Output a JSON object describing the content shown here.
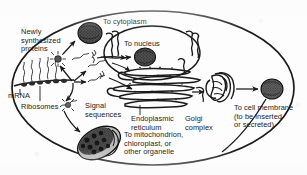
{
  "figure": {
    "background_color": "#fdfdfd",
    "ink_color": "#1a1a1a"
  },
  "labels": {
    "newly_synthesized_proteins": "Newly\nsynthesized\nproteins",
    "mrna": "mRNA",
    "ribosomes": "Ribosomes",
    "signal_sequences": "Signal\nsequences",
    "to_cytoplasm": "To cytoplasm",
    "to_nucleus": "To nucleus",
    "endoplasmic_reticulum": "Endoplasmic\nreticulum",
    "golgi_complex": "Golgi\ncomplex",
    "to_cell_membrane": "To cell membrane\n(to be inserted\nor secreted)",
    "to_mitochondrion": "To mitochondrion,\nchloroplast, or\nother organelle"
  },
  "structures": {
    "cell_membrane": "cell-outline",
    "nucleus": "nucleus-organelle",
    "rough_er": "endoplasmic-reticulum-stack",
    "golgi": "golgi-stack",
    "mitochondrion": "mitochondrion-organelle",
    "cytoplasmic_protein": "protein-globule",
    "nuclear_protein": "protein-globule",
    "secreted_protein": "protein-globule",
    "ribosome_chain": "mrna-ribosome-chain"
  },
  "colors": {
    "ink": "#1a1a1a",
    "paper": "#fdfdfd",
    "organelle_fill": "#4a4a4a",
    "light_fill": "#e8e8e8"
  }
}
